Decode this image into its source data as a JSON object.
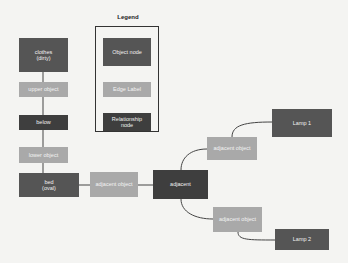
{
  "legend": {
    "title": "Legend",
    "items": [
      {
        "label": "Object node",
        "type": "object"
      },
      {
        "label": "Edge Label",
        "type": "edge-label"
      },
      {
        "label": "Relationship\nnode",
        "type": "relationship"
      }
    ]
  },
  "nodes": {
    "clothes": "clothes\n(dirty)",
    "upper_object": "upper object",
    "below": "below",
    "lower_object": "lower object",
    "bed": "bed\n(oval)",
    "adjacent_object_left": "adjacent object",
    "adjacent": "adjacent",
    "adjacent_object_upper": "adjacent object",
    "lamp1": "Lamp 1",
    "adjacent_object_lower": "adjacent object",
    "lamp2": "Lamp 2"
  },
  "colors": {
    "object_node": "#555555",
    "relationship_node": "#3e3e3e",
    "edge_label": "#a9a9a9",
    "edge_line": "#444444"
  }
}
